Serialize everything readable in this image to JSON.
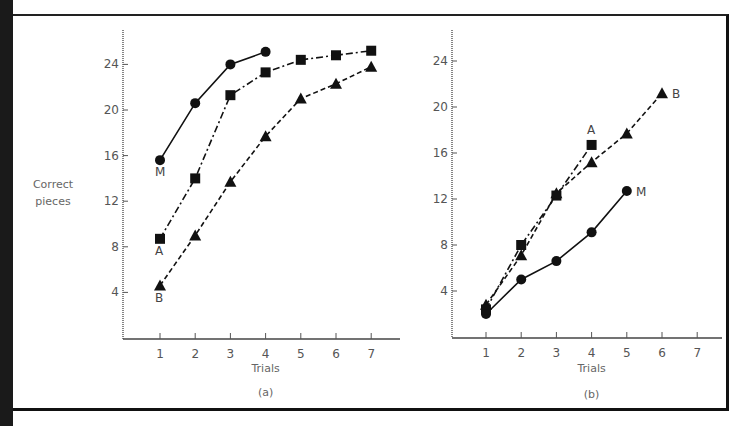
{
  "figure": {
    "ylabel_line1": "Correct",
    "ylabel_line2": "pieces"
  },
  "chart_data": [
    {
      "type": "line",
      "panel_label": "(a)",
      "title": "",
      "xlabel": "Trials",
      "ylabel": "Correct pieces",
      "x": [
        1,
        2,
        3,
        4,
        5,
        6,
        7
      ],
      "x_ticks": [
        "1",
        "2",
        "3",
        "4",
        "5",
        "6",
        "7"
      ],
      "y_ticks": [
        "4",
        "8",
        "12",
        "16",
        "20",
        "24"
      ],
      "ylim": [
        0,
        27
      ],
      "grid": false,
      "series": [
        {
          "name": "M",
          "marker": "circle",
          "linestyle": "solid",
          "values": [
            15.6,
            20.6,
            24.0,
            25.1
          ]
        },
        {
          "name": "A",
          "marker": "square",
          "linestyle": "dash-dot",
          "values": [
            8.7,
            14.0,
            21.3,
            23.3,
            24.4,
            24.8,
            25.2
          ]
        },
        {
          "name": "B",
          "marker": "triangle",
          "linestyle": "dashed",
          "values": [
            4.6,
            9.0,
            13.7,
            17.7,
            21.0,
            22.3,
            23.8
          ]
        }
      ]
    },
    {
      "type": "line",
      "panel_label": "(b)",
      "title": "",
      "xlabel": "Trials",
      "ylabel": "Correct pieces",
      "x": [
        1,
        2,
        3,
        4,
        5,
        6,
        7
      ],
      "x_ticks": [
        "1",
        "2",
        "3",
        "4",
        "5",
        "6",
        "7"
      ],
      "y_ticks": [
        "4",
        "8",
        "12",
        "16",
        "20",
        "24"
      ],
      "ylim": [
        0,
        27
      ],
      "grid": false,
      "series": [
        {
          "name": "M",
          "marker": "circle",
          "linestyle": "solid",
          "values": [
            2.0,
            5.0,
            6.6,
            9.1,
            12.7
          ]
        },
        {
          "name": "A",
          "marker": "square",
          "linestyle": "dash-dot",
          "values": [
            2.4,
            8.0,
            12.3,
            16.7
          ]
        },
        {
          "name": "B",
          "marker": "triangle",
          "linestyle": "dashed",
          "values": [
            2.8,
            7.1,
            12.5,
            15.2,
            17.7,
            21.2
          ]
        }
      ]
    }
  ],
  "layout": {
    "panels": [
      {
        "x0": 123,
        "x_axis_end": 400,
        "y_axis_top": 30,
        "y_zero": 338,
        "px_per_unit": 11.4,
        "x_first": 160,
        "x_step": 35.2,
        "xlabel_y": 372,
        "panel_label_y": 396,
        "labels": {
          "M": [
            155,
            176
          ],
          "A": [
            155,
            255
          ],
          "B": [
            155,
            302
          ]
        }
      },
      {
        "x0": 452,
        "x_axis_end": 722,
        "y_axis_top": 30,
        "y_zero": 337,
        "px_per_unit": 11.5,
        "x_first": 486,
        "x_step": 35.2,
        "xlabel_y": 372,
        "panel_label_y": 398,
        "labels": {
          "M": [
            636,
            196
          ],
          "A": [
            587,
            134
          ],
          "B": [
            672,
            98
          ]
        }
      }
    ],
    "ink": "#111111"
  }
}
